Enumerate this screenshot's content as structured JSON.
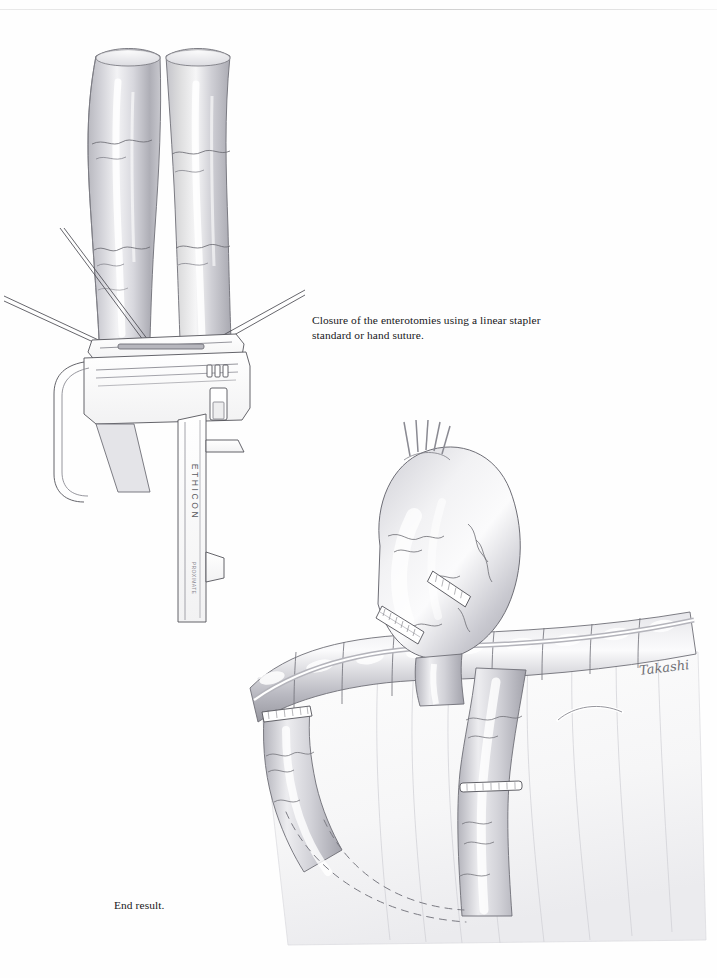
{
  "page": {
    "kind": "surgical-atlas-plate",
    "background_color": "#fefefe",
    "ink_color": "#1a1a1a",
    "header_rule_color": "#dcdcdc",
    "folio_text": ""
  },
  "captions": {
    "top": "Closure of the enterotomies using a linear stapler standard or hand suture.",
    "bottom": "End result."
  },
  "figures": [
    {
      "id": "figure-stapler",
      "name": "linear-stapler-closing-enterotomies",
      "title": "Closure of the enterotomies using a linear stapler",
      "device_label": "ETHICON",
      "device_sublabel": "PROXIMATE",
      "elements": [
        "two small-bowel limbs converging in a V",
        "linear cutting stapler applied across the common enterotomy",
        "three pairs of stay sutures elevating the bowel edges",
        "mesenteric vessel markings on serosa"
      ]
    },
    {
      "id": "figure-endresult",
      "name": "completed-roux-en-y-gastric-bypass",
      "title": "End result",
      "elements": [
        "gastric pouch with transverse and vertical staple lines",
        "divided gastric remnant",
        "transverse colon with haustra",
        "transverse mesocolon",
        "retrocolic Roux limb",
        "stapled blind end of biliopancreatic limb",
        "jejunojejunostomy staple line",
        "dashed lines indicating retrocolic tunnel path"
      ],
      "artist_signature": "Takashi"
    }
  ],
  "palette": {
    "tissue_light": "#e8e8ea",
    "tissue_mid": "#c3c3c8",
    "tissue_dark": "#9a9aa1",
    "outline": "#5a5a60",
    "vessel": "#6d6d74",
    "metal": "#ffffff",
    "metal_outline": "#53535a",
    "suture": "#4a4a52",
    "dashed_guide": "#7b7b83"
  }
}
